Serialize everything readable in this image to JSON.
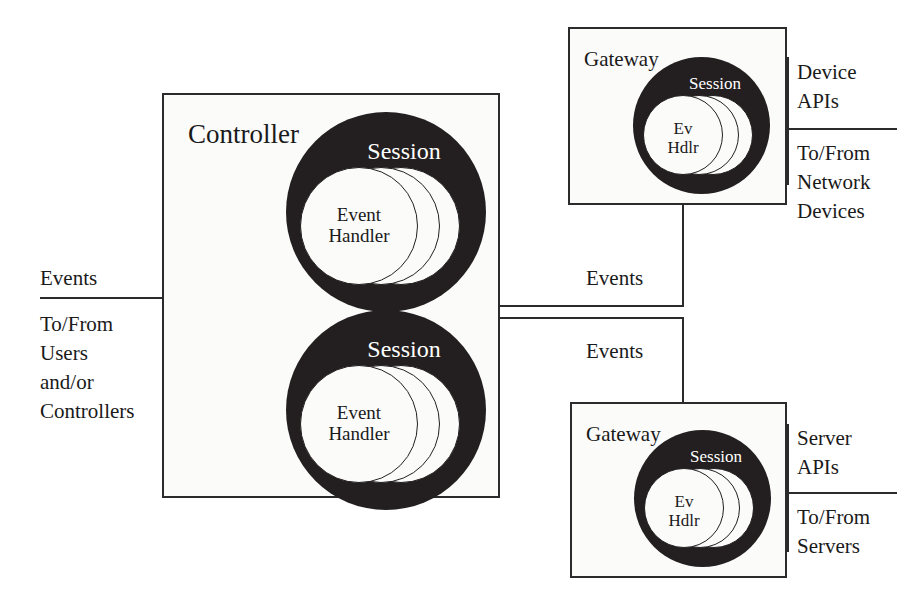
{
  "diagram": {
    "colors": {
      "ink": "#231f20",
      "line": "#2b2b2b",
      "box_fill": "#fbfbfa",
      "session_fill": "#231f20",
      "disc_fill": "#fbfbfa",
      "session_text": "#ffffff",
      "page_bg": "#ffffff"
    }
  },
  "controller": {
    "label": "Controller",
    "sessions": [
      {
        "title": "Session",
        "handler_line1": "Event",
        "handler_line2": "Handler"
      },
      {
        "title": "Session",
        "handler_line1": "Event",
        "handler_line2": "Handler"
      }
    ]
  },
  "gateways": [
    {
      "label": "Gateway",
      "session": {
        "title": "Session",
        "handler_line1": "Ev",
        "handler_line2": "Hdlr"
      },
      "api_line1": "Device",
      "api_line2": "APIs",
      "endpoint_line1": "To/From",
      "endpoint_line2": "Network",
      "endpoint_line3": "Devices"
    },
    {
      "label": "Gateway",
      "session": {
        "title": "Session",
        "handler_line1": "Ev",
        "handler_line2": "Hdlr"
      },
      "api_line1": "Server",
      "api_line2": "APIs",
      "endpoint_line1": "To/From",
      "endpoint_line2": "Servers",
      "endpoint_line3": ""
    }
  ],
  "left_interface": {
    "events_label": "Events",
    "endpoint_line1": "To/From",
    "endpoint_line2": "Users",
    "endpoint_line3": "and/or",
    "endpoint_line4": "Controllers"
  },
  "connectors": {
    "top_events_label": "Events",
    "bottom_events_label": "Events"
  }
}
